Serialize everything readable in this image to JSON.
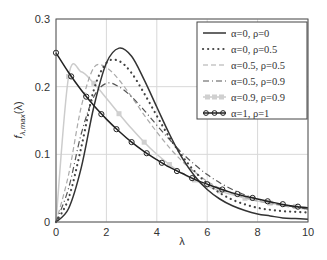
{
  "chart_data": {
    "type": "line",
    "title": "",
    "xlabel": "λ",
    "ylabel": "f_λ,max(λ)",
    "xlim": [
      0,
      10
    ],
    "ylim": [
      0,
      0.3
    ],
    "grid": true,
    "legend_position": "upper right",
    "x_ticks": [
      "0",
      "2",
      "4",
      "6",
      "8",
      "10"
    ],
    "y_ticks": [
      "0",
      "0.1",
      "0.2",
      "0.3"
    ],
    "x": [
      0,
      0.5,
      1,
      1.5,
      2,
      2.5,
      3,
      3.5,
      4,
      4.5,
      5,
      5.5,
      6,
      6.5,
      7,
      7.5,
      8,
      8.5,
      9,
      9.5,
      10
    ],
    "series": [
      {
        "name": "α=0, ρ=0",
        "style": "solid",
        "color": "#333333",
        "values": [
          0,
          0.02,
          0.08,
          0.17,
          0.235,
          0.257,
          0.245,
          0.21,
          0.17,
          0.13,
          0.095,
          0.068,
          0.048,
          0.034,
          0.024,
          0.017,
          0.012,
          0.009,
          0.006,
          0.005,
          0.004
        ]
      },
      {
        "name": "α=0, ρ=0.5",
        "style": "dotted",
        "color": "#444444",
        "values": [
          0,
          0.035,
          0.11,
          0.195,
          0.235,
          0.238,
          0.22,
          0.19,
          0.157,
          0.125,
          0.098,
          0.075,
          0.057,
          0.043,
          0.033,
          0.026,
          0.021,
          0.018,
          0.016,
          0.015,
          0.014
        ]
      },
      {
        "name": "α=0.5, ρ=0.5",
        "style": "dashed",
        "color": "#aaaaaa",
        "values": [
          0,
          0.07,
          0.17,
          0.228,
          0.228,
          0.21,
          0.185,
          0.158,
          0.133,
          0.11,
          0.09,
          0.074,
          0.06,
          0.05,
          0.042,
          0.036,
          0.031,
          0.027,
          0.024,
          0.021,
          0.019
        ]
      },
      {
        "name": "α=0.5, ρ=0.9",
        "style": "dashdot",
        "color": "#555555",
        "values": [
          0,
          0.05,
          0.13,
          0.185,
          0.205,
          0.2,
          0.185,
          0.165,
          0.143,
          0.122,
          0.102,
          0.085,
          0.07,
          0.058,
          0.048,
          0.04,
          0.034,
          0.029,
          0.025,
          0.022,
          0.019
        ]
      },
      {
        "name": "α=0.9, ρ=0.9",
        "style": "solid-square-markers",
        "color": "#cccccc",
        "values": [
          0,
          0.215,
          0.222,
          0.205,
          0.183,
          0.16,
          0.138,
          0.118,
          0.1,
          0.085,
          0.072,
          0.062,
          0.053,
          0.046,
          0.04,
          0.035,
          0.031,
          0.028,
          0.025,
          0.023,
          0.021
        ]
      },
      {
        "name": "α=1, ρ=1",
        "style": "solid-circle-markers",
        "color": "#222222",
        "values": [
          0.25,
          0.221,
          0.195,
          0.172,
          0.152,
          0.134,
          0.118,
          0.104,
          0.092,
          0.081,
          0.072,
          0.063,
          0.056,
          0.049,
          0.043,
          0.038,
          0.034,
          0.03,
          0.026,
          0.023,
          0.021
        ]
      }
    ]
  }
}
